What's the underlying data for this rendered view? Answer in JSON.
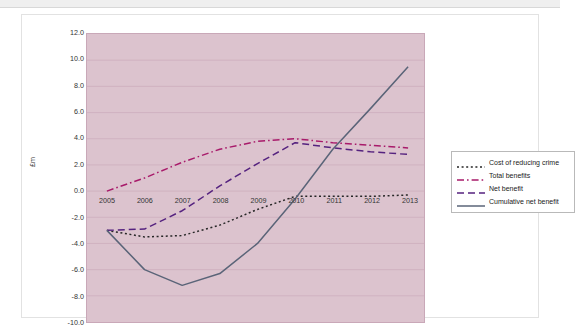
{
  "chart_data": {
    "type": "line",
    "title": "",
    "xlabel": "",
    "ylabel": "£m",
    "x": [
      2005,
      2006,
      2007,
      2008,
      2009,
      2010,
      2011,
      2012,
      2013
    ],
    "xtick_labels": [
      "2005",
      "2006",
      "2007",
      "2008",
      "2009",
      "2010",
      "2011",
      "2012",
      "2013"
    ],
    "ylim": [
      -10.0,
      12.0
    ],
    "ytick_labels": [
      "12.0",
      "10.0",
      "8.0",
      "6.0",
      "4.0",
      "2.0",
      "0.0",
      "-2.0",
      "-4.0",
      "-6.0",
      "-8.0",
      "-10.0"
    ],
    "yticks": [
      12.0,
      10.0,
      8.0,
      6.0,
      4.0,
      2.0,
      0.0,
      -2.0,
      -4.0,
      -6.0,
      -8.0,
      -10.0
    ],
    "grid": true,
    "legend_position": "right",
    "plot_background": "#dcc3ce",
    "grid_color": "#c9a8b8",
    "series": [
      {
        "name": "Cost of reducing crime",
        "color": "#262626",
        "style": "dotted",
        "values": [
          -3.0,
          -3.5,
          -3.4,
          -2.6,
          -1.4,
          -0.4,
          -0.4,
          -0.4,
          -0.3
        ]
      },
      {
        "name": "Total benefits",
        "color": "#a81a6a",
        "style": "dash-dot",
        "values": [
          0.0,
          1.0,
          2.2,
          3.2,
          3.8,
          4.0,
          3.7,
          3.5,
          3.3
        ]
      },
      {
        "name": "Net benefit",
        "color": "#55227f",
        "style": "dashed",
        "values": [
          -3.0,
          -2.9,
          -1.5,
          0.4,
          2.1,
          3.7,
          3.3,
          3.0,
          2.8
        ]
      },
      {
        "name": "Cumulative net benefit",
        "color": "#5a6478",
        "style": "solid",
        "values": [
          -3.0,
          -6.0,
          -7.2,
          -6.3,
          -4.0,
          -0.6,
          3.2,
          6.3,
          9.5
        ]
      }
    ]
  }
}
